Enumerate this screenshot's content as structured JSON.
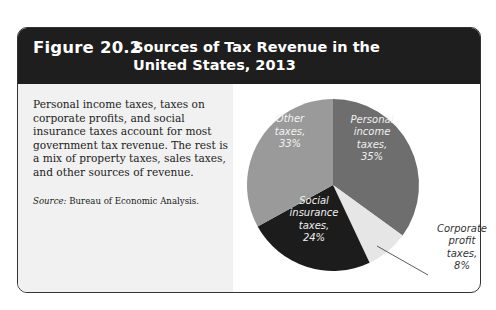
{
  "figure": {
    "number": "Figure 20.2",
    "title": "Sources of Tax Revenue in the United States, 2013",
    "title_line1": "Sources of Tax Revenue in the",
    "title_line2": "United States, 2013"
  },
  "description": "Personal income taxes, taxes on corporate profits, and social insurance taxes account for most government tax revenue. The rest is a mix of property taxes, sales taxes, and other sources of revenue.",
  "source": {
    "label": "Source:",
    "text": "Bureau of Economic Analysis."
  },
  "chart_data": {
    "type": "pie",
    "title": "Sources of Tax Revenue in the United States, 2013",
    "categories": [
      "Personal income taxes",
      "Corporate profit taxes",
      "Social insurance taxes",
      "Other taxes"
    ],
    "values": [
      35,
      8,
      24,
      33
    ],
    "unit": "%",
    "colors": [
      "#6e6e6e",
      "#e6e6e6",
      "#1c1c1c",
      "#9a9a9a"
    ],
    "labels": [
      {
        "lines": [
          "Personal",
          "income",
          "taxes,",
          "35%"
        ],
        "placement": "inside"
      },
      {
        "lines": [
          "Corporate",
          "profit",
          "taxes,",
          "8%"
        ],
        "placement": "outside-with-leader"
      },
      {
        "lines": [
          "Social",
          "insurance",
          "taxes,",
          "24%"
        ],
        "placement": "inside"
      },
      {
        "lines": [
          "Other",
          "taxes,",
          "33%"
        ],
        "placement": "inside"
      }
    ],
    "start_angle": "12 o'clock",
    "direction": "clockwise",
    "legend": "none"
  }
}
